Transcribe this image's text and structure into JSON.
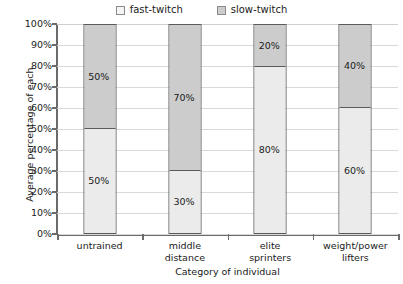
{
  "chart_data": {
    "type": "bar",
    "subtype": "100% stacked bar",
    "title": "",
    "xlabel": "Category of individual",
    "ylabel": "Average percentage of each",
    "ylim": [
      0,
      100
    ],
    "ytick_labels": [
      "100%",
      "90%",
      "80%",
      "70%",
      "60%",
      "50%",
      "40%",
      "30%",
      "20%",
      "10%",
      "0%"
    ],
    "ytick_values": [
      100,
      90,
      80,
      70,
      60,
      50,
      40,
      30,
      20,
      10,
      0
    ],
    "grid": true,
    "legend_position": "top-center",
    "categories": [
      "untrained",
      "middle distance",
      "elite sprinters",
      "weight/power lifters"
    ],
    "category_lines": [
      [
        "untrained"
      ],
      [
        "middle",
        "distance"
      ],
      [
        "elite",
        "sprinters"
      ],
      [
        "weight/power",
        "lifters"
      ]
    ],
    "series": [
      {
        "name": "fast-twitch",
        "color": "#ebebeb",
        "values": [
          50,
          30,
          80,
          60
        ],
        "labels": [
          "50%",
          "30%",
          "80%",
          "60%"
        ]
      },
      {
        "name": "slow-twitch",
        "color": "#cccccc",
        "values": [
          50,
          70,
          20,
          40
        ],
        "labels": [
          "50%",
          "70%",
          "20%",
          "40%"
        ]
      }
    ],
    "stack_order_bottom_to_top": [
      "fast-twitch",
      "slow-twitch"
    ]
  },
  "legend": {
    "items": [
      {
        "label": "fast-twitch",
        "swatch": "fast"
      },
      {
        "label": "slow-twitch",
        "swatch": "slow"
      }
    ]
  },
  "colors": {
    "fast_twitch_fill": "#ebebeb",
    "slow_twitch_fill": "#cccccc",
    "bar_border": "#5a5a5a",
    "gridline": "#d9d9d9",
    "axis_line": "#6b6b6b",
    "text": "#1a1a1a",
    "background": "#ffffff"
  }
}
